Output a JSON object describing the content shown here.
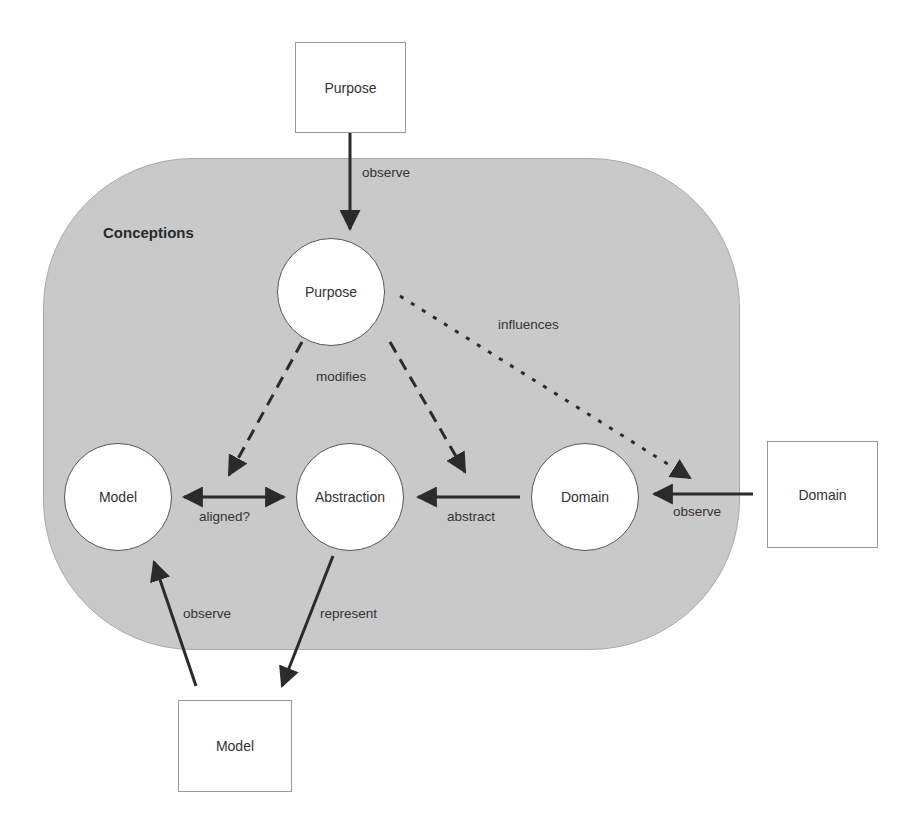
{
  "diagram": {
    "region": {
      "label": "Conceptions",
      "fill": "#c9c9c9"
    },
    "external_boxes": {
      "purpose": {
        "label": "Purpose"
      },
      "domain": {
        "label": "Domain"
      },
      "model": {
        "label": "Model"
      }
    },
    "nodes": {
      "purpose": {
        "label": "Purpose"
      },
      "model": {
        "label": "Model"
      },
      "abstraction": {
        "label": "Abstraction"
      },
      "domain": {
        "label": "Domain"
      }
    },
    "edges": {
      "purpose_box_to_purpose": {
        "label": "observe",
        "style": "solid"
      },
      "purpose_modifies": {
        "label": "modifies",
        "style": "dashed"
      },
      "purpose_influences": {
        "label": "influences",
        "style": "dotted"
      },
      "model_abstraction": {
        "label": "aligned?",
        "style": "solid-bidirectional"
      },
      "domain_to_abstraction": {
        "label": "abstract",
        "style": "solid"
      },
      "domain_box_to_domain": {
        "label": "observe",
        "style": "solid"
      },
      "model_box_to_model": {
        "label": "observe",
        "style": "solid"
      },
      "abstraction_to_model_box": {
        "label": "represent",
        "style": "solid"
      }
    }
  }
}
